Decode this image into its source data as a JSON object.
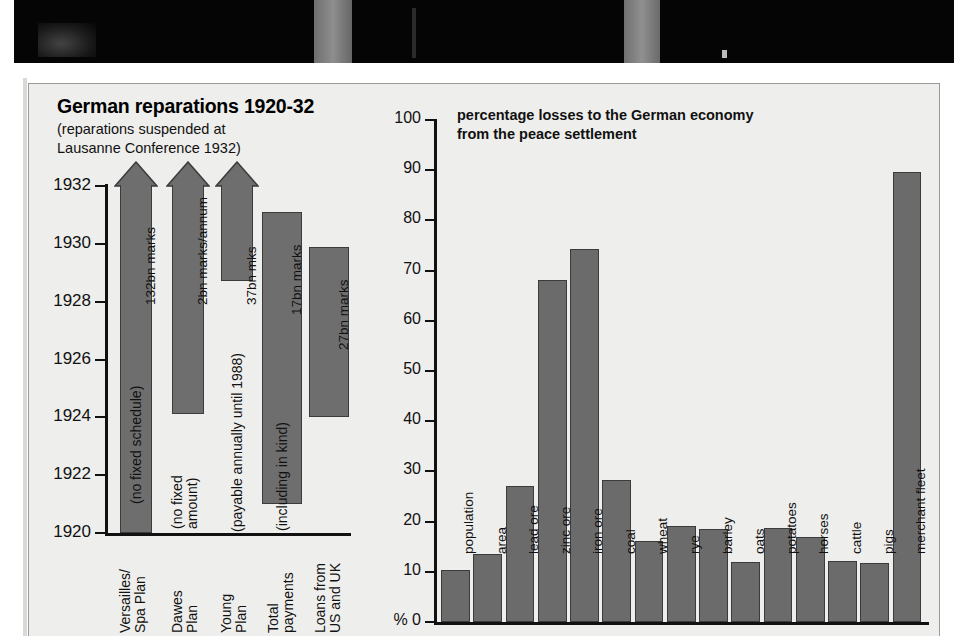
{
  "photo": {
    "caption": ""
  },
  "left_chart": {
    "title": "German reparations 1920-32",
    "subtitle": "(reparations suspended at\nLausanne Conference 1932)",
    "y_ticks": [
      "1932",
      "1930",
      "1928",
      "1926",
      "1924",
      "1922",
      "1920"
    ],
    "bars": [
      {
        "category": "Versailles/\nSpa Plan",
        "amount_label": "132bn marks",
        "note_label": "(no fixed schedule)",
        "start": 1920,
        "end": 1932,
        "arrow": true
      },
      {
        "category": "Dawes\nPlan",
        "amount_label": "2bn marks/annum",
        "note_label": "(no fixed\namount)",
        "start": 1924.1,
        "end": 1932,
        "arrow": true
      },
      {
        "category": "Young\nPlan",
        "amount_label": "37bn mks",
        "note_label": "(payable annually until 1988)",
        "start": 1928.7,
        "end": 1932,
        "arrow": true
      },
      {
        "category": "Total\npayments",
        "amount_label": "17bn marks",
        "note_label": "(including in kind)",
        "start": 1921.0,
        "end": 1931.1,
        "arrow": false
      },
      {
        "category": "Loans from\nUS and UK",
        "amount_label": "27bn marks",
        "note_label": "",
        "start": 1924.0,
        "end": 1929.9,
        "arrow": false
      }
    ]
  },
  "chart_data": {
    "type": "bar",
    "xlabel": "",
    "ylabel": "%",
    "ylim": [
      0,
      100
    ],
    "y_ticks": [
      0,
      10,
      20,
      30,
      40,
      50,
      60,
      70,
      80,
      90,
      100
    ],
    "y_axis_zero_label": "% 0",
    "grid": false,
    "legend": "none",
    "categories": [
      "population",
      "area",
      "lead ore",
      "zinc ore",
      "iron ore",
      "coal",
      "wheat",
      "rye",
      "barley",
      "oats",
      "potatoes",
      "horses",
      "cattle",
      "pigs",
      "merchant fleet"
    ],
    "values": [
      10.3,
      13.6,
      27.0,
      68.2,
      74.3,
      28.3,
      16.1,
      19.2,
      18.6,
      12.0,
      18.8,
      16.9,
      12.2,
      11.8,
      89.6
    ]
  },
  "colors": {
    "bar_fill": "#6e6e6e",
    "bar_stroke": "#3b3b3b",
    "panel_bg": "#eeeeec",
    "axis": "#111111",
    "photo_bg": "#050505"
  }
}
